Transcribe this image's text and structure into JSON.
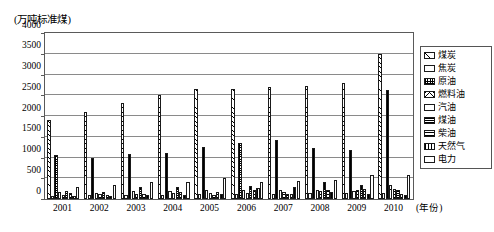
{
  "chart_data": {
    "type": "bar",
    "title": "",
    "ylabel": "(万吨标准煤)",
    "xlabel": "(年份)",
    "ylim": [
      0,
      4000
    ],
    "yticks": [
      0,
      500,
      1000,
      1500,
      2000,
      2500,
      3000,
      3500,
      4000
    ],
    "ytick_labels": [
      "0",
      "500",
      "1000",
      "1500",
      "2000",
      "2500",
      "3000",
      "3500",
      "4000"
    ],
    "grid": true,
    "legend_position": "right",
    "categories": [
      "2001",
      "2002",
      "2003",
      "2004",
      "2005",
      "2006",
      "2007",
      "2008",
      "2009",
      "2010"
    ],
    "series": [
      {
        "name": "煤炭",
        "pattern": "diagonal-hatch",
        "values": [
          1900,
          2090,
          2310,
          2510,
          2650,
          2650,
          2710,
          2730,
          2790,
          3500
        ]
      },
      {
        "name": "焦炭",
        "pattern": "solid-white",
        "values": [
          75,
          85,
          95,
          105,
          120,
          125,
          130,
          135,
          140,
          155
        ]
      },
      {
        "name": "原油",
        "pattern": "checkerboard",
        "values": [
          1050,
          1000,
          1090,
          1120,
          1260,
          1350,
          1430,
          1240,
          1180,
          2620
        ]
      },
      {
        "name": "燃料油",
        "pattern": "cross-diagonal",
        "values": [
          160,
          150,
          190,
          195,
          215,
          210,
          220,
          225,
          205,
          340
        ]
      },
      {
        "name": "汽油",
        "pattern": "horizontal-thin",
        "values": [
          105,
          110,
          130,
          135,
          150,
          155,
          175,
          195,
          210,
          240
        ]
      },
      {
        "name": "煤油",
        "pattern": "dense-dark",
        "values": [
          195,
          180,
          295,
          300,
          105,
          320,
          125,
          410,
          330,
          215
        ]
      },
      {
        "name": "柴油",
        "pattern": "horizontal-bold",
        "values": [
          135,
          100,
          120,
          165,
          180,
          215,
          120,
          215,
          245,
          125
        ]
      },
      {
        "name": "天然气",
        "pattern": "vertical-bold",
        "values": [
          70,
          75,
          85,
          95,
          110,
          260,
          300,
          160,
          120,
          105
        ]
      },
      {
        "name": "电力",
        "pattern": "plain-outline",
        "values": [
          290,
          330,
          420,
          410,
          505,
          420,
          440,
          465,
          590,
          590
        ]
      }
    ]
  },
  "legend": {
    "items": [
      {
        "label": "煤炭"
      },
      {
        "label": "焦炭"
      },
      {
        "label": "原油"
      },
      {
        "label": "燃料油"
      },
      {
        "label": "汽油"
      },
      {
        "label": "煤油"
      },
      {
        "label": "柴油"
      },
      {
        "label": "天然气"
      },
      {
        "label": "电力"
      }
    ]
  },
  "axes": {
    "y_unit_label": "(万吨标准煤)",
    "x_unit_label": "(年份)"
  }
}
